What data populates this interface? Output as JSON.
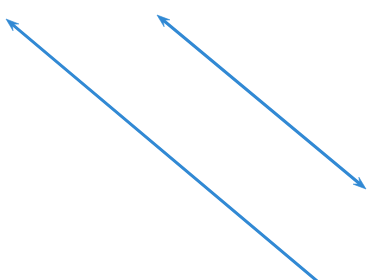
{
  "canvas": {
    "width": 372,
    "height": 280,
    "background_color": "#ffffff",
    "title": "Two blue arrows on white background"
  },
  "style": {
    "stroke_color": "#3189d4",
    "stroke_width": 3,
    "line_cap": "round",
    "arrowhead_length": 13,
    "arrowhead_width": 9
  },
  "shapes": [
    {
      "name": "arrow-down-left-diagonal",
      "type": "arrow",
      "heads": "start",
      "description": "Long diagonal arrow pointing up-left, tail runs off the bottom edge",
      "x1": 6,
      "y1": 19,
      "x2": 317,
      "y2": 281,
      "color": "#3189d4"
    },
    {
      "name": "arrow-double-headed-diagonal",
      "type": "arrow",
      "heads": "both",
      "description": "Double-headed diagonal arrow from upper-left to lower-right",
      "x1": 157,
      "y1": 15,
      "x2": 366,
      "y2": 189,
      "color": "#3189d4"
    }
  ]
}
